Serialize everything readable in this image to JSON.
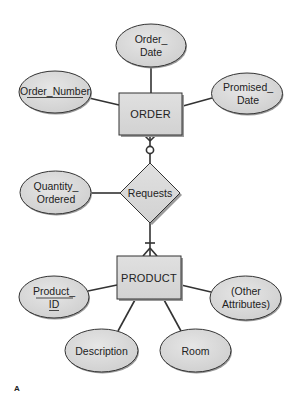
{
  "diagram": {
    "type": "entity-relationship",
    "figure_label": "A",
    "entities": [
      {
        "id": "order",
        "label": "ORDER"
      },
      {
        "id": "product",
        "label": "PRODUCT"
      }
    ],
    "relationship": {
      "id": "requests",
      "label": "Requests"
    },
    "attributes": {
      "order_date": {
        "line1": "Order_",
        "line2": "Date",
        "owner": "ORDER",
        "key": false
      },
      "order_number": {
        "line1": "Order_Number",
        "owner": "ORDER",
        "key": true
      },
      "promised_date": {
        "line1": "Promised_",
        "line2": "Date",
        "owner": "ORDER",
        "key": false
      },
      "quantity_ordered": {
        "line1": "Quantity_",
        "line2": "Ordered",
        "owner": "Requests",
        "key": false
      },
      "product_id": {
        "line1": "Product_",
        "line2": "ID",
        "owner": "PRODUCT",
        "key": true
      },
      "other_attributes": {
        "line1": "(Other",
        "line2": "Attributes)",
        "owner": "PRODUCT",
        "key": false
      },
      "description": {
        "line1": "Description",
        "owner": "PRODUCT",
        "key": false
      },
      "room": {
        "line1": "Room",
        "owner": "PRODUCT",
        "key": false
      }
    },
    "cardinality": {
      "order_side": "zero-or-many",
      "product_side": "one-or-many"
    },
    "colors": {
      "fill": "#d9d9d9",
      "stroke": "#333333",
      "shadow": "#9a9a9a"
    }
  }
}
